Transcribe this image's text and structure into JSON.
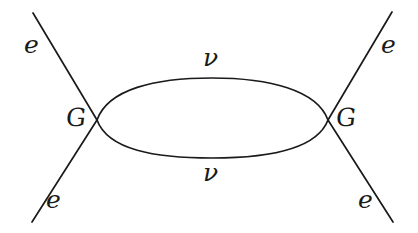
{
  "figure": {
    "kind": "feynman-diagram",
    "background_color": "#ffffff",
    "ink_color": "#1a1a1a",
    "width": 418,
    "height": 233
  },
  "labels": {
    "electron_top_left": "e",
    "electron_bottom_left": "e",
    "electron_top_right": "e",
    "electron_bottom_right": "e",
    "neutrino_top": "ν",
    "neutrino_bottom": "ν",
    "vertex_left": "G",
    "vertex_right": "G"
  },
  "geometry": {
    "stroke_width": 1.7,
    "vertex_left": {
      "x": 97,
      "y": 120
    },
    "vertex_right": {
      "x": 328,
      "y": 120
    },
    "loop": {
      "cx": 212.5,
      "cy": 118,
      "rx": 116,
      "ry": 40
    },
    "legs": [
      {
        "name": "leg-top-left",
        "x1": 33,
        "y1": 13,
        "x2": 97,
        "y2": 120
      },
      {
        "name": "leg-bottom-left",
        "x1": 32,
        "y1": 222,
        "x2": 97,
        "y2": 120
      },
      {
        "name": "leg-top-right",
        "x1": 392,
        "y1": 12,
        "x2": 328,
        "y2": 120
      },
      {
        "name": "leg-bottom-right",
        "x1": 393,
        "y1": 222,
        "x2": 328,
        "y2": 120
      }
    ]
  },
  "label_positions": {
    "electron_top_left": {
      "left": 24,
      "top": 32
    },
    "electron_bottom_left": {
      "left": 46,
      "top": 187
    },
    "electron_top_right": {
      "left": 381,
      "top": 32
    },
    "electron_bottom_right": {
      "left": 358,
      "top": 187
    },
    "neutrino_top": {
      "left": 203,
      "top": 45
    },
    "neutrino_bottom": {
      "left": 203,
      "top": 160
    },
    "vertex_left": {
      "left": 66,
      "top": 105
    },
    "vertex_right": {
      "left": 336,
      "top": 105
    }
  }
}
